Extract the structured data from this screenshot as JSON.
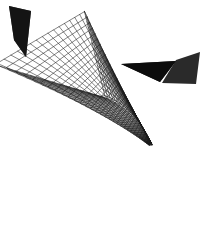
{
  "figure": {
    "title": "3D wireframe mesh surface",
    "caption": "Curved triangular prism wireframe with dark triangular aperture",
    "background_color": "#ffffff",
    "line_color": "#1a1a1a",
    "shadow_color": "#101010",
    "width": 213,
    "height": 226
  },
  "chart_data": {
    "type": "line",
    "title": "3D wireframe mesh surface",
    "subtitle": "",
    "xlabel": "",
    "ylabel": "",
    "grid": true,
    "legend": null,
    "render": {
      "projection": "perspective",
      "line_color": "#1a1a1a",
      "line_width": 0.55,
      "background": "#ffffff",
      "u_divisions": 46,
      "v_divisions": 30,
      "shaded_regions": [
        {
          "name": "central-aperture",
          "fill": "#0d0d0d",
          "polygon": [
            [
              121,
              64
            ],
            [
              176,
              61
            ],
            [
              160,
              82
            ]
          ]
        },
        {
          "name": "left-fold-shadow",
          "fill": "#141414",
          "polygon": [
            [
              9,
              6
            ],
            [
              31,
              11
            ],
            [
              26,
              57
            ],
            [
              14,
              40
            ]
          ]
        },
        {
          "name": "upper-right-fold-shadow",
          "fill": "#2a2a2a",
          "polygon": [
            [
              176,
              60
            ],
            [
              200,
              52
            ],
            [
              196,
              84
            ],
            [
              162,
              83
            ]
          ]
        }
      ],
      "silhouette": [
        [
          9,
          6
        ],
        [
          78,
          2
        ],
        [
          150,
          1
        ],
        [
          207,
          24
        ],
        [
          209,
          60
        ],
        [
          200,
          120
        ],
        [
          182,
          178
        ],
        [
          168,
          214
        ],
        [
          150,
          206
        ],
        [
          120,
          178
        ],
        [
          92,
          146
        ],
        [
          62,
          110
        ],
        [
          34,
          70
        ],
        [
          14,
          38
        ]
      ]
    },
    "surface": {
      "description": "Triangular cross-section tube swept along a curved axis, viewed from outside with one open end facing the viewer",
      "cross_section": "triangle",
      "sweep": "curved taper",
      "apex_point": [
        168,
        214
      ],
      "mouth_center": [
        152,
        72
      ]
    }
  }
}
